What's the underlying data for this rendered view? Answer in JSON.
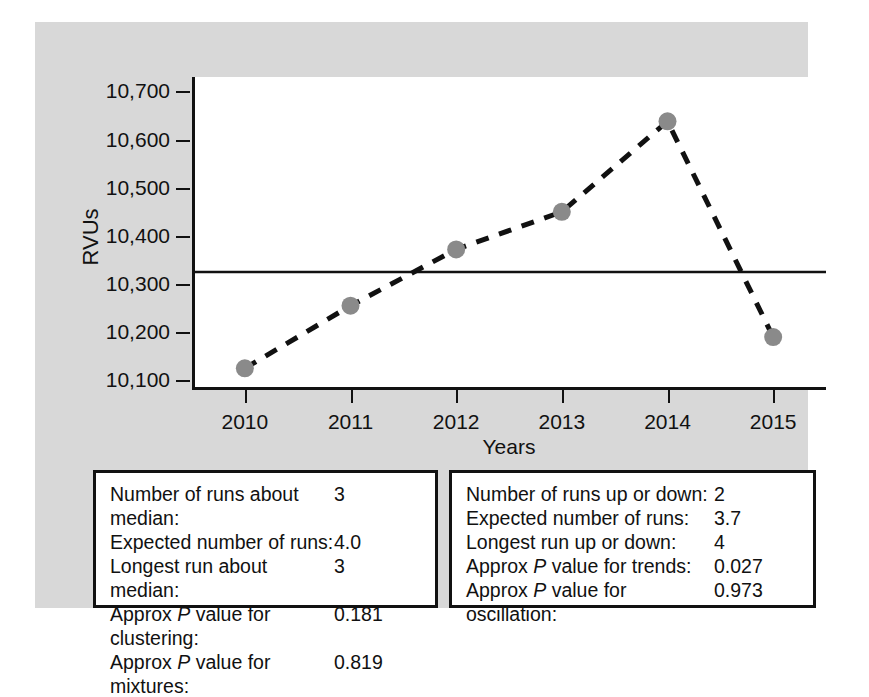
{
  "chart_data": {
    "type": "line",
    "title": "",
    "xlabel": "Years",
    "ylabel": "RVUs",
    "categories": [
      "2010",
      "2011",
      "2012",
      "2013",
      "2014",
      "2015"
    ],
    "x": [
      2010,
      2011,
      2012,
      2013,
      2014,
      2015
    ],
    "values": [
      10125,
      10255,
      10372,
      10450,
      10638,
      10190
    ],
    "series": [
      {
        "name": "RVUs",
        "values": [
          10125,
          10255,
          10372,
          10450,
          10638,
          10190
        ],
        "line_style": "dashed",
        "marker": "circle",
        "marker_color": "#8a8a8a",
        "line_color": "#111111"
      }
    ],
    "reference_line": {
      "name": "median",
      "value": 10325,
      "style": "solid",
      "color": "#111111"
    },
    "ylim": [
      10080,
      10730
    ],
    "yticks": [
      10100,
      10200,
      10300,
      10400,
      10500,
      10600,
      10700
    ],
    "ytick_labels": [
      "10,100",
      "10,200",
      "10,300",
      "10,400",
      "10,500",
      "10,600",
      "10,700"
    ],
    "xtick_labels": [
      "2010",
      "2011",
      "2012",
      "2013",
      "2014",
      "2015"
    ],
    "grid": false,
    "legend": "none"
  },
  "axes": {
    "y_title": "RVUs",
    "x_title": "Years"
  },
  "stats_left": {
    "rows": [
      {
        "label": "Number of runs about median:",
        "value": "3"
      },
      {
        "label": "Expected number of runs:",
        "value": "4.0"
      },
      {
        "label": "Longest run about median:",
        "value": "3"
      },
      {
        "label_pre": "Approx ",
        "label_it": "P",
        "label_post": " value for clustering:",
        "value": "0.181"
      },
      {
        "label_pre": "Approx ",
        "label_it": "P",
        "label_post": " value for mixtures:",
        "value": "0.819"
      }
    ],
    "row0_label": "Number of runs about median:",
    "row0_value": "3",
    "row1_label": "Expected number of runs:",
    "row1_value": "4.0",
    "row2_label": "Longest run about median:",
    "row2_value": "3",
    "row3_pre": "Approx ",
    "row3_it": "P",
    "row3_post": " value for clustering:",
    "row3_value": "0.181",
    "row4_pre": "Approx ",
    "row4_it": "P",
    "row4_post": " value for mixtures:",
    "row4_value": "0.819"
  },
  "stats_right": {
    "row0_label": "Number of runs up or down:",
    "row0_value": "2",
    "row1_label": "Expected number of runs:",
    "row1_value": "3.7",
    "row2_label": "Longest run up or down:",
    "row2_value": "4",
    "row3_pre": "Approx ",
    "row3_it": "P",
    "row3_post": " value for trends:",
    "row3_value": "0.027",
    "row4_pre": "Approx ",
    "row4_it": "P",
    "row4_post": " value for oscillation:",
    "row4_value": "0.973"
  },
  "colors": {
    "panel_background": "#d8d8d8",
    "plot_background": "#ffffff",
    "axis": "#111111",
    "marker": "#8a8a8a"
  }
}
